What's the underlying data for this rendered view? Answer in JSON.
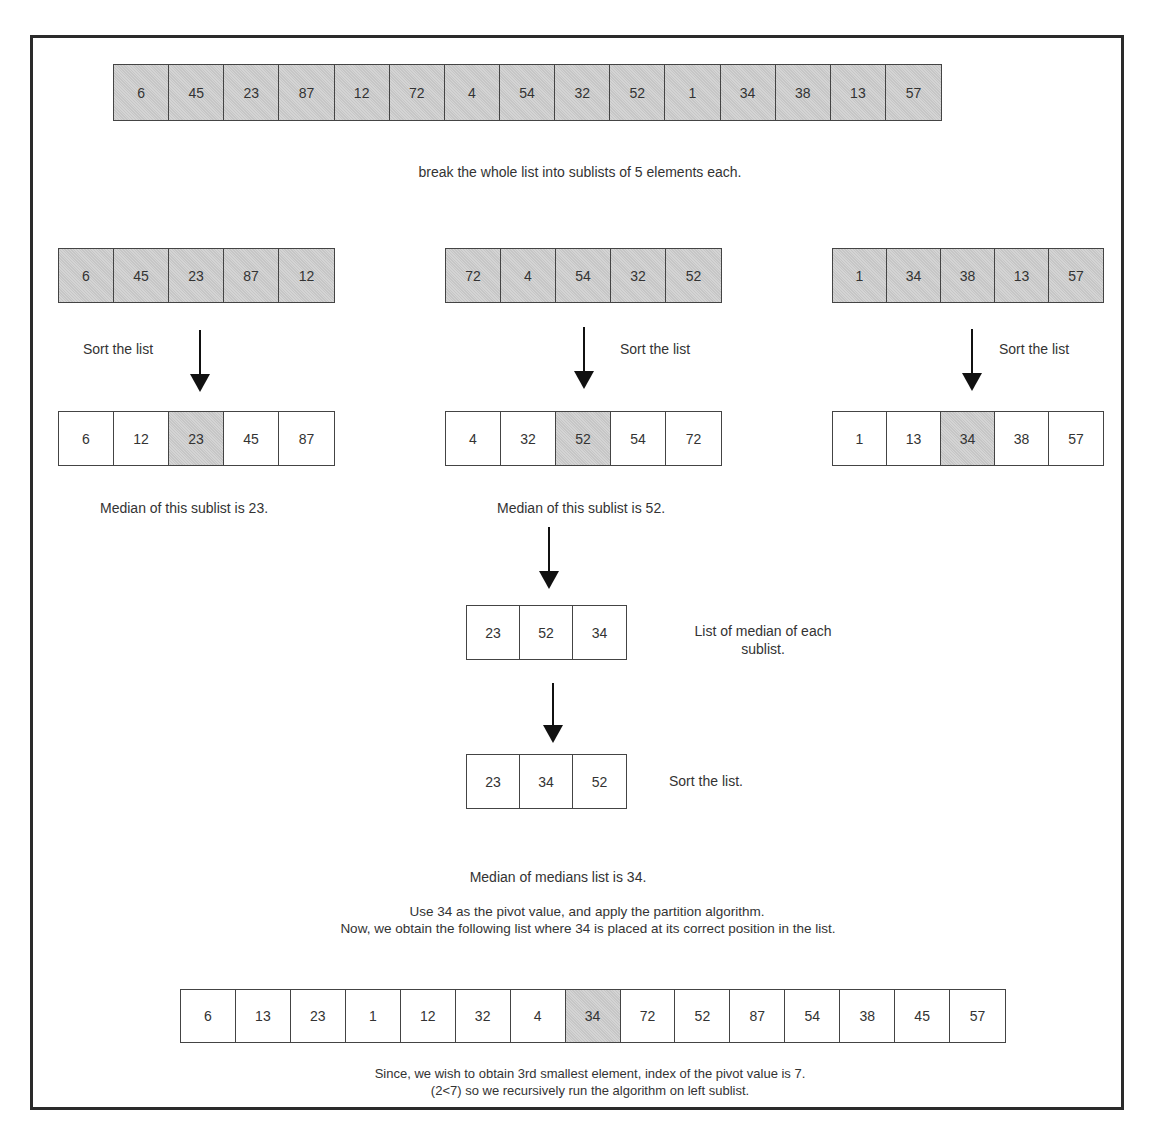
{
  "top_line_fragment": "",
  "original_list": {
    "values": [
      6,
      45,
      23,
      87,
      12,
      72,
      4,
      54,
      32,
      52,
      1,
      34,
      38,
      13,
      57
    ],
    "caption": "break the whole list into sublists of 5 elements each."
  },
  "sublists": [
    {
      "unsorted": [
        6,
        45,
        23,
        87,
        12
      ],
      "sort_label": "Sort the list",
      "sorted": [
        6,
        12,
        23,
        45,
        87
      ],
      "median_index": 2,
      "median_caption": "Median of this sublist is 23."
    },
    {
      "unsorted": [
        72,
        4,
        54,
        32,
        52
      ],
      "sort_label": "Sort the list",
      "sorted": [
        4,
        32,
        52,
        54,
        72
      ],
      "median_index": 2,
      "median_caption": "Median of this sublist is 52."
    },
    {
      "unsorted": [
        1,
        34,
        38,
        13,
        57
      ],
      "sort_label": "Sort the list",
      "sorted": [
        1,
        13,
        34,
        38,
        57
      ],
      "median_index": 2,
      "median_caption": ""
    }
  ],
  "medians_list": {
    "values": [
      23,
      52,
      34
    ],
    "label_line1": "List of median of each",
    "label_line2": "sublist."
  },
  "sorted_medians": {
    "values": [
      23,
      34,
      52
    ],
    "label": "Sort the list."
  },
  "median_of_medians_text": "Median of medians list is 34.",
  "pivot_text_line1": "Use 34 as the pivot value, and apply the partition algorithm.",
  "pivot_text_line2": "Now, we obtain the following list where 34 is placed at its correct position in the list.",
  "partitioned_list": {
    "values": [
      6,
      13,
      23,
      1,
      12,
      32,
      4,
      34,
      72,
      52,
      87,
      54,
      38,
      45,
      57
    ],
    "pivot_index": 7
  },
  "conclusion_line1": "Since, we wish to obtain 3rd smallest element, index of the pivot value is 7.",
  "conclusion_line2": "(2<7) so we recursively run the algorithm on left sublist.",
  "colors": {
    "shaded_cell": "#cccccc",
    "border": "#444444",
    "frame": "#2a2a2a",
    "text": "#333333"
  }
}
